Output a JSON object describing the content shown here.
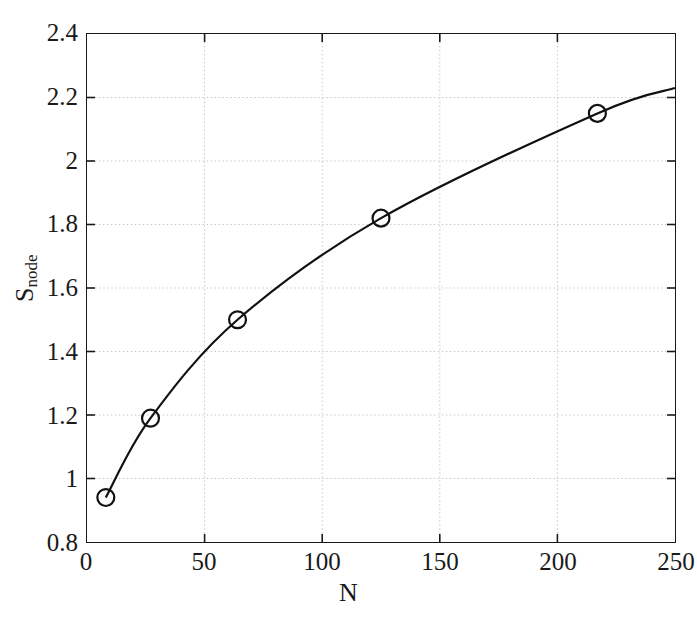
{
  "chart_data": {
    "type": "line",
    "title": "",
    "xlabel": "N",
    "ylabel": "S_node",
    "ylabel_base": "S",
    "ylabel_sub": "node",
    "xlim": [
      0,
      250
    ],
    "ylim": [
      0.8,
      2.4
    ],
    "grid": true,
    "grid_style": "dotted",
    "legend": "none",
    "marker": "circle-open",
    "line_color": "#111111",
    "marker_color": "#111111",
    "grid_color": "#c8c8c8",
    "axis_color": "#1a1a1a",
    "background": "#ffffff",
    "xticks": [
      0,
      50,
      100,
      150,
      200,
      250
    ],
    "xtick_labels": [
      "0",
      "50",
      "100",
      "150",
      "200",
      "250"
    ],
    "yticks": [
      0.8,
      1.0,
      1.2,
      1.4,
      1.6,
      1.8,
      2.0,
      2.2,
      2.4
    ],
    "ytick_labels": [
      "0.8",
      "1",
      "1.2",
      "1.4",
      "1.6",
      "1.8",
      "2",
      "2.2",
      "2.4"
    ],
    "series": [
      {
        "name": "S_node vs N",
        "x": [
          8,
          27,
          64,
          125,
          217
        ],
        "values": [
          0.94,
          1.19,
          1.5,
          1.82,
          2.15
        ]
      }
    ],
    "curve_x": [
      8,
      27,
      64,
      125,
      217,
      250
    ],
    "curve_y": [
      0.94,
      1.19,
      1.5,
      1.82,
      2.15,
      2.23
    ]
  }
}
